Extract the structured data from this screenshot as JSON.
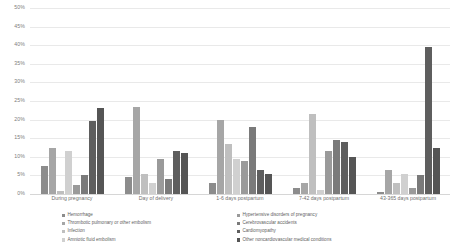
{
  "chart_data": {
    "type": "bar",
    "title": "",
    "subtitle": "",
    "xlabel": "",
    "ylabel": "",
    "ylim": [
      0,
      50
    ],
    "ytick_labels": [
      "50%",
      "45%",
      "40%",
      "35%",
      "30%",
      "25%",
      "20%",
      "15%",
      "10%",
      "5%",
      "0%"
    ],
    "ytick_values": [
      50,
      45,
      40,
      35,
      30,
      25,
      20,
      15,
      10,
      5,
      0
    ],
    "grid": true,
    "legend_position": "bottom",
    "legend_columns": 2,
    "value_suffix": "%",
    "categories": [
      "During pregnancy",
      "Day of delivery",
      "1-6 days postpartum",
      "7-42 days postpartum",
      "43-365 days postpartum"
    ],
    "series": [
      {
        "name": "Hemorrhage",
        "color": "#8c8c8c",
        "values": [
          7.5,
          4.5,
          3.0,
          1.5,
          0.5
        ]
      },
      {
        "name": "Thrombotic pulmonary or other embolism",
        "color": "#a6a6a6",
        "values": [
          12.5,
          23.5,
          20.0,
          3.0,
          6.5
        ]
      },
      {
        "name": "Infection",
        "color": "#bfbfbf",
        "values": [
          0.8,
          5.5,
          13.5,
          21.5,
          3.0
        ]
      },
      {
        "name": "Amniotic fluid embolism",
        "color": "#d0d0d0",
        "values": [
          11.5,
          3.0,
          9.5,
          1.0,
          5.5
        ]
      },
      {
        "name": "Hypertensive disorders of pregnancy",
        "color": "#9a9a9a",
        "values": [
          2.5,
          9.5,
          9.0,
          11.5,
          1.5
        ]
      },
      {
        "name": "Cerebrovascular accidents",
        "color": "#7a7a7a",
        "values": [
          5.0,
          4.0,
          18.0,
          14.5,
          5.0
        ]
      },
      {
        "name": "Cardiomyopathy",
        "color": "#5e5e5e",
        "values": [
          19.5,
          11.5,
          6.5,
          14.0,
          39.5
        ]
      },
      {
        "name": "Other noncardiovascular medical conditions",
        "color": "#555555",
        "values": [
          23.0,
          11.0,
          5.5,
          10.0,
          12.5
        ]
      }
    ]
  }
}
